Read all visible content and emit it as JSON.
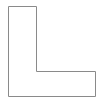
{
  "diagram": {
    "shape": "L-shape",
    "fill_color": "#ffffff",
    "stroke_color": "#8a8a8a"
  }
}
